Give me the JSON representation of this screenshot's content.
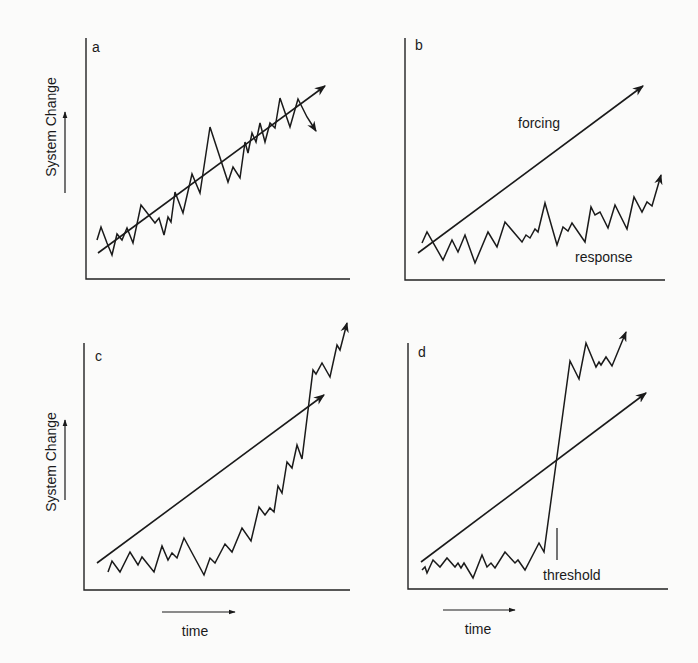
{
  "figure": {
    "y_axis_label": "System Change",
    "x_axis_label": "time",
    "panels": [
      {
        "id": "a",
        "label": "a",
        "axis": {
          "x": 86,
          "top": 38,
          "bottom": 279,
          "right": 350
        },
        "label_pos": [
          92,
          52
        ],
        "forcing": {
          "from": [
            98,
            253
          ],
          "to": [
            325,
            86
          ]
        },
        "response": [
          [
            97,
            240
          ],
          [
            101,
            227
          ],
          [
            107,
            243
          ],
          [
            112,
            255
          ],
          [
            117,
            234
          ],
          [
            122,
            240
          ],
          [
            127,
            228
          ],
          [
            133,
            243
          ],
          [
            141,
            205
          ],
          [
            155,
            223
          ],
          [
            159,
            218
          ],
          [
            164,
            235
          ],
          [
            168,
            217
          ],
          [
            171,
            222
          ],
          [
            175,
            192
          ],
          [
            183,
            213
          ],
          [
            192,
            174
          ],
          [
            200,
            193
          ],
          [
            210,
            127
          ],
          [
            228,
            182
          ],
          [
            233,
            167
          ],
          [
            240,
            178
          ],
          [
            245,
            142
          ],
          [
            248,
            153
          ],
          [
            252,
            133
          ],
          [
            256,
            142
          ],
          [
            260,
            123
          ],
          [
            265,
            142
          ],
          [
            270,
            123
          ],
          [
            275,
            128
          ],
          [
            280,
            98
          ],
          [
            290,
            127
          ],
          [
            298,
            99
          ],
          [
            307,
            117
          ],
          [
            316,
            131
          ]
        ],
        "annotations": []
      },
      {
        "id": "b",
        "label": "b",
        "axis": {
          "x": 405,
          "top": 38,
          "bottom": 280,
          "right": 665
        },
        "label_pos": [
          415,
          50
        ],
        "forcing": {
          "from": [
            418,
            253
          ],
          "to": [
            643,
            86
          ]
        },
        "response": [
          [
            422,
            243
          ],
          [
            427,
            232
          ],
          [
            443,
            260
          ],
          [
            452,
            240
          ],
          [
            458,
            252
          ],
          [
            465,
            235
          ],
          [
            475,
            263
          ],
          [
            488,
            232
          ],
          [
            497,
            247
          ],
          [
            505,
            222
          ],
          [
            522,
            242
          ],
          [
            526,
            235
          ],
          [
            530,
            238
          ],
          [
            535,
            229
          ],
          [
            538,
            232
          ],
          [
            545,
            203
          ],
          [
            557,
            245
          ],
          [
            563,
            227
          ],
          [
            568,
            231
          ],
          [
            572,
            223
          ],
          [
            585,
            242
          ],
          [
            591,
            207
          ],
          [
            595,
            215
          ],
          [
            600,
            212
          ],
          [
            608,
            228
          ],
          [
            615,
            205
          ],
          [
            627,
            229
          ],
          [
            634,
            197
          ],
          [
            642,
            212
          ],
          [
            647,
            202
          ],
          [
            652,
            206
          ],
          [
            661,
            175
          ]
        ],
        "annotations": [
          {
            "text": "forcing",
            "pos": [
              518,
              128
            ]
          },
          {
            "text": "response",
            "pos": [
              575,
              262
            ]
          }
        ]
      },
      {
        "id": "c",
        "label": "c",
        "axis": {
          "x": 84,
          "top": 343,
          "bottom": 590,
          "right": 350
        },
        "label_pos": [
          95,
          361
        ],
        "forcing": {
          "from": [
            97,
            563
          ],
          "to": [
            324,
            395
          ]
        },
        "response": [
          [
            108,
            572
          ],
          [
            112,
            561
          ],
          [
            120,
            572
          ],
          [
            130,
            552
          ],
          [
            138,
            565
          ],
          [
            142,
            557
          ],
          [
            154,
            572
          ],
          [
            162,
            546
          ],
          [
            168,
            560
          ],
          [
            172,
            553
          ],
          [
            177,
            558
          ],
          [
            184,
            538
          ],
          [
            204,
            575
          ],
          [
            210,
            558
          ],
          [
            215,
            563
          ],
          [
            225,
            544
          ],
          [
            232,
            552
          ],
          [
            242,
            528
          ],
          [
            251,
            541
          ],
          [
            259,
            507
          ],
          [
            265,
            515
          ],
          [
            270,
            508
          ],
          [
            274,
            512
          ],
          [
            278,
            486
          ],
          [
            282,
            493
          ],
          [
            287,
            462
          ],
          [
            292,
            468
          ],
          [
            297,
            445
          ],
          [
            302,
            459
          ],
          [
            313,
            370
          ],
          [
            316,
            374
          ],
          [
            322,
            363
          ],
          [
            330,
            377
          ],
          [
            337,
            345
          ],
          [
            340,
            350
          ],
          [
            347,
            323
          ]
        ],
        "annotations": []
      },
      {
        "id": "d",
        "label": "d",
        "axis": {
          "x": 408,
          "top": 343,
          "bottom": 589,
          "right": 668
        },
        "label_pos": [
          418,
          357
        ],
        "forcing": {
          "from": [
            421,
            562
          ],
          "to": [
            646,
            393
          ]
        },
        "response": [
          [
            422,
            570
          ],
          [
            425,
            567
          ],
          [
            427,
            573
          ],
          [
            433,
            560
          ],
          [
            440,
            567
          ],
          [
            447,
            558
          ],
          [
            455,
            567
          ],
          [
            458,
            563
          ],
          [
            461,
            568
          ],
          [
            464,
            563
          ],
          [
            473,
            578
          ],
          [
            482,
            555
          ],
          [
            487,
            567
          ],
          [
            491,
            563
          ],
          [
            495,
            568
          ],
          [
            505,
            552
          ],
          [
            515,
            563
          ],
          [
            518,
            560
          ],
          [
            525,
            570
          ],
          [
            539,
            543
          ],
          [
            544,
            552
          ],
          [
            570,
            361
          ],
          [
            579,
            379
          ],
          [
            586,
            343
          ],
          [
            596,
            367
          ],
          [
            599,
            362
          ],
          [
            601,
            365
          ],
          [
            606,
            357
          ],
          [
            612,
            366
          ],
          [
            626,
            332
          ]
        ],
        "annotations": [
          {
            "text": "threshold",
            "pos": [
              543,
              580
            ]
          }
        ],
        "threshold_arrow": {
          "x": 557,
          "from_y": 560,
          "to_y": 528
        }
      }
    ],
    "side_labels": [
      {
        "panel": "a",
        "text_x": 52,
        "text_y": 127,
        "arrow_x": 65,
        "arrow_from": 193,
        "arrow_to": 112
      },
      {
        "panel": "c",
        "text_x": 52,
        "text_y": 462,
        "arrow_x": 65,
        "arrow_from": 500,
        "arrow_to": 420
      }
    ],
    "time_labels": [
      {
        "panel": "c",
        "arrow_from": 162,
        "arrow_to": 235,
        "arrow_y": 612,
        "text_x": 195,
        "text_y": 636
      },
      {
        "panel": "d",
        "arrow_from": 443,
        "arrow_to": 515,
        "arrow_y": 610,
        "text_x": 478,
        "text_y": 634
      }
    ]
  },
  "chart_data": {
    "type": "line",
    "title": "",
    "xlabel": "time",
    "ylabel": "System Change",
    "panels": [
      {
        "id": "a",
        "series": [
          {
            "name": "forcing",
            "shape": "linear increasing"
          },
          {
            "name": "response",
            "shape": "noisy, closely tracks forcing"
          }
        ]
      },
      {
        "id": "b",
        "series": [
          {
            "name": "forcing",
            "shape": "linear increasing"
          },
          {
            "name": "response",
            "shape": "noisy, weak/slow rise, damped"
          }
        ],
        "annotations": [
          "forcing",
          "response"
        ]
      },
      {
        "id": "c",
        "series": [
          {
            "name": "forcing",
            "shape": "linear increasing"
          },
          {
            "name": "response",
            "shape": "flat then accelerating nonlinear rise overtaking forcing"
          }
        ]
      },
      {
        "id": "d",
        "series": [
          {
            "name": "forcing",
            "shape": "linear increasing"
          },
          {
            "name": "response",
            "shape": "flat then abrupt jump at threshold, then high plateau"
          }
        ],
        "annotations": [
          "threshold"
        ]
      }
    ],
    "grid": false,
    "legend": "none"
  }
}
